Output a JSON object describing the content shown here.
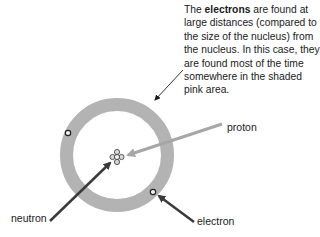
{
  "caption": {
    "prefix": "The ",
    "bold": "electrons",
    "suffix": " are found at large distances (compared to the size of the nucleus) from the nucleus. In this case, they are found most of the time somewhere in the shaded pink area."
  },
  "labels": {
    "proton": "proton",
    "neutron": "neutron",
    "electron": "electron"
  },
  "colors": {
    "ring": "#b3b3b3",
    "proton_arrow": "#a6a6a6",
    "dark_arrow": "#3a3a3a",
    "text": "#1a1a1a"
  }
}
